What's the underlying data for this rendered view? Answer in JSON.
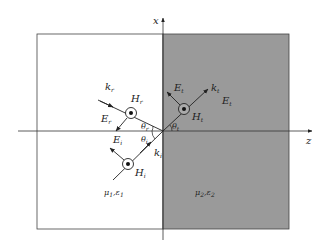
{
  "diagram": {
    "type": "oblique incidence of plane wave at dielectric interface (TM / parallel polarization)",
    "axes": {
      "vertical": "x",
      "horizontal": "z"
    },
    "colors": {
      "medium1": "#ffffff",
      "medium2": "#9a9a9a",
      "line": "#333333"
    },
    "medium1": {
      "label": "μ1,ε1",
      "mu": "μ",
      "mu_sub": "1",
      "eps": "ε",
      "eps_sub": "1"
    },
    "medium2": {
      "label": "μ2,ε2",
      "mu": "μ",
      "mu_sub": "2",
      "eps": "ε",
      "eps_sub": "2"
    },
    "incident": {
      "k": "k",
      "k_sub": "i",
      "E": "E",
      "E_sub": "i",
      "H": "H",
      "H_sub": "i",
      "theta": "θ",
      "theta_sub": "i"
    },
    "reflected": {
      "k": "k",
      "k_sub": "r",
      "E": "E",
      "E_sub": "r",
      "H": "H",
      "H_sub": "r",
      "theta": "θ",
      "theta_sub": "r"
    },
    "transmitted": {
      "k": "k",
      "k_sub": "t",
      "E": "E",
      "E_sub": "t",
      "H": "H",
      "H_sub": "t",
      "theta": "θ",
      "theta_sub": "t",
      "E_extra": "E",
      "E_extra_sub": "t"
    }
  }
}
